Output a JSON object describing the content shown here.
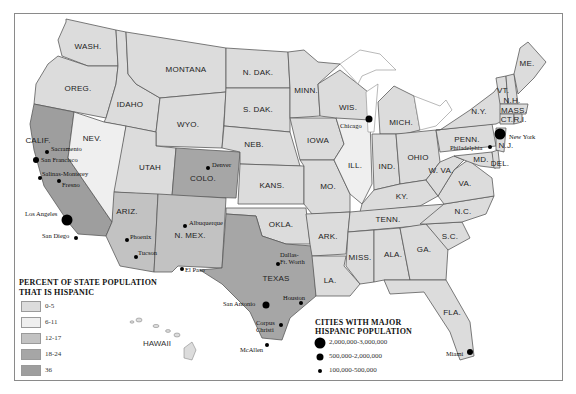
{
  "colors": {
    "c0_5": "#dcdcdc",
    "c6_11": "#efefef",
    "c12_17": "#c2c2c2",
    "c18_24": "#a6a6a6",
    "c36": "#9e9e9e",
    "border": "#5a5a5a"
  },
  "states": [
    {
      "id": "WA",
      "label": "WASH.",
      "x": 88,
      "y": 46,
      "bin": "c0_5",
      "points": "66,19 116,30 118,66 88,66 62,56 58,40 66,22"
    },
    {
      "id": "OR",
      "label": "OREG.",
      "x": 78,
      "y": 88,
      "bin": "c0_5",
      "points": "58,56 88,66 118,66 116,84 106,118 34,104 36,84 48,64"
    },
    {
      "id": "ID",
      "label": "IDAHO",
      "x": 130,
      "y": 104,
      "bin": "c0_5",
      "points": "116,30 126,32 128,74 136,84 160,98 156,132 104,122 106,118 116,84 118,66"
    },
    {
      "id": "MT",
      "label": "MONTANA",
      "x": 186,
      "y": 69,
      "bin": "c0_5",
      "points": "126,32 226,48 226,92 160,98 136,84 128,74"
    },
    {
      "id": "WY",
      "label": "WYO.",
      "x": 188,
      "y": 124,
      "bin": "c0_5",
      "points": "160,98 226,92 222,148 156,146 156,132"
    },
    {
      "id": "CA",
      "label": "CALIF.",
      "x": 38,
      "y": 140,
      "bin": "c36",
      "points": "34,104 74,112 68,158 112,222 106,236 78,234 68,222 44,186 34,150 30,124"
    },
    {
      "id": "NV",
      "label": "NEV.",
      "x": 92,
      "y": 138,
      "bin": "c6_11",
      "points": "74,112 104,122 126,126 114,208 112,222 68,158"
    },
    {
      "id": "UT",
      "label": "UTAH",
      "x": 150,
      "y": 167,
      "bin": "c0_5",
      "points": "126,126 156,132 156,146 176,148 172,196 114,192"
    },
    {
      "id": "CO",
      "label": "COLO.",
      "x": 203,
      "y": 178,
      "bin": "c18_24",
      "points": "176,148 240,152 236,198 172,196"
    },
    {
      "id": "AZ",
      "label": "ARIZ.",
      "x": 127,
      "y": 211,
      "bin": "c12_17",
      "points": "114,192 158,194 154,272 120,266 106,236 112,222"
    },
    {
      "id": "NM",
      "label": "N. MEX.",
      "x": 190,
      "y": 235,
      "bin": "c12_17",
      "points": "158,194 226,198 222,268 178,266 172,272 154,272"
    },
    {
      "id": "ND",
      "label": "N. DAK.",
      "x": 258,
      "y": 72,
      "bin": "c0_5",
      "points": "226,48 288,52 290,88 226,88"
    },
    {
      "id": "SD",
      "label": "S. DAK.",
      "x": 258,
      "y": 109,
      "bin": "c0_5",
      "points": "226,88 290,88 290,132 224,126"
    },
    {
      "id": "NE",
      "label": "NEB.",
      "x": 254,
      "y": 144,
      "bin": "c0_5",
      "points": "224,126 290,132 300,166 240,164 240,152 222,148"
    },
    {
      "id": "KS",
      "label": "KANS.",
      "x": 272,
      "y": 185,
      "bin": "c0_5",
      "points": "240,164 304,166 304,204 238,204"
    },
    {
      "id": "OK",
      "label": "OKLA.",
      "x": 281,
      "y": 224,
      "bin": "c0_5",
      "points": "226,208 306,208 310,244 286,244 262,236 256,216 226,214"
    },
    {
      "id": "TX",
      "label": "TEXAS",
      "x": 276,
      "y": 278,
      "bin": "c18_24",
      "points": "226,214 256,216 262,236 286,244 312,246 316,296 290,318 282,340 262,338 250,312 236,298 222,284 200,270 222,268"
    },
    {
      "id": "MN",
      "label": "MINN.",
      "x": 306,
      "y": 90,
      "bin": "c0_5",
      "points": "288,52 304,50 318,62 340,64 318,84 320,116 290,118 290,88"
    },
    {
      "id": "IA",
      "label": "IOWA",
      "x": 318,
      "y": 140,
      "bin": "c0_5",
      "points": "290,118 336,118 344,144 334,160 300,160"
    },
    {
      "id": "MO",
      "label": "MO.",
      "x": 328,
      "y": 186,
      "bin": "c0_5",
      "points": "300,160 334,160 350,194 350,212 312,214 304,204 304,166"
    },
    {
      "id": "AR",
      "label": "ARK.",
      "x": 328,
      "y": 236,
      "bin": "c0_5",
      "points": "306,214 350,212 346,254 312,256 310,244"
    },
    {
      "id": "LA",
      "label": "LA.",
      "x": 330,
      "y": 280,
      "bin": "c0_5",
      "points": "312,256 346,256 344,266 360,284 350,296 322,296 316,296"
    },
    {
      "id": "WI",
      "label": "WIS.",
      "x": 348,
      "y": 107,
      "bin": "c0_5",
      "points": "318,84 340,70 358,84 368,92 368,132 336,118 320,116"
    },
    {
      "id": "IL",
      "label": "ILL.",
      "x": 355,
      "y": 165,
      "bin": "c6_11",
      "points": "336,118 370,120 372,184 362,204 350,194 334,160 344,144"
    },
    {
      "id": "MI",
      "label": "MICH.",
      "x": 401,
      "y": 122,
      "bin": "c0_5",
      "points": "378,102 394,86 414,96 420,130 404,134 380,134"
    },
    {
      "id": "IN",
      "label": "IND.",
      "x": 387,
      "y": 166,
      "bin": "c0_5",
      "points": "372,134 396,134 400,184 374,190"
    },
    {
      "id": "OH",
      "label": "OHIO",
      "x": 418,
      "y": 157,
      "bin": "c0_5",
      "points": "396,134 436,130 440,162 426,180 400,184"
    },
    {
      "id": "KY",
      "label": "KY.",
      "x": 402,
      "y": 196,
      "bin": "c0_5",
      "points": "362,204 374,190 400,184 426,180 438,196 420,206 360,212"
    },
    {
      "id": "TN",
      "label": "TENN.",
      "x": 388,
      "y": 219,
      "bin": "c0_5",
      "points": "350,212 420,206 446,204 440,224 348,232"
    },
    {
      "id": "MS",
      "label": "MISS.",
      "x": 360,
      "y": 257,
      "bin": "c0_5",
      "points": "348,232 374,230 374,282 360,284 346,266"
    },
    {
      "id": "AL",
      "label": "ALA.",
      "x": 393,
      "y": 254,
      "bin": "c0_5",
      "points": "374,230 400,228 410,280 384,280 374,282"
    },
    {
      "id": "GA",
      "label": "GA.",
      "x": 424,
      "y": 249,
      "bin": "c0_5",
      "points": "400,228 426,224 448,248 446,280 410,280"
    },
    {
      "id": "FL",
      "label": "FLA.",
      "x": 452,
      "y": 312,
      "bin": "c0_5",
      "points": "384,280 446,280 470,322 474,356 460,360 450,332 424,292 390,294"
    },
    {
      "id": "SC",
      "label": "S.C.",
      "x": 450,
      "y": 236,
      "bin": "c0_5",
      "points": "426,224 462,222 470,238 448,250"
    },
    {
      "id": "NC",
      "label": "N.C.",
      "x": 463,
      "y": 211,
      "bin": "c0_5",
      "points": "420,224 444,204 494,196 486,214 462,222 426,224"
    },
    {
      "id": "VA",
      "label": "VA.",
      "x": 465,
      "y": 183,
      "bin": "c0_5",
      "points": "438,196 454,170 468,160 492,178 494,196 444,204"
    },
    {
      "id": "WV",
      "label": "W. VA.",
      "x": 441,
      "y": 170,
      "bin": "c0_5",
      "points": "426,180 440,162 454,156 464,160 454,170 438,196"
    },
    {
      "id": "PA",
      "label": "PENN.",
      "x": 467,
      "y": 139,
      "bin": "c0_5",
      "points": "436,130 492,124 496,146 440,152"
    },
    {
      "id": "NY",
      "label": "N.Y.",
      "x": 479,
      "y": 111,
      "bin": "c0_5",
      "points": "440,130 470,110 494,92 500,84 504,120 496,124 436,130"
    },
    {
      "id": "MD",
      "label": "MD.",
      "x": 481,
      "y": 159,
      "bin": "c0_5",
      "points": "454,156 492,152 496,168 480,166 464,160"
    },
    {
      "id": "DE",
      "label": "DEL.",
      "x": 500,
      "y": 163,
      "bin": "c0_5",
      "points": "492,152 498,150 500,168 494,168"
    },
    {
      "id": "NJ",
      "label": "N.J.",
      "x": 506,
      "y": 145,
      "bin": "c0_5",
      "points": "496,128 506,128 504,152 496,150"
    },
    {
      "id": "VT",
      "label": "VT.",
      "x": 503,
      "y": 90,
      "bin": "c0_5",
      "points": "496,78 506,76 508,104 500,104"
    },
    {
      "id": "NH",
      "label": "N.H.",
      "x": 512,
      "y": 100,
      "bin": "c0_5",
      "points": "506,76 514,74 518,104 508,104"
    },
    {
      "id": "ME",
      "label": "ME.",
      "x": 527,
      "y": 63,
      "bin": "c0_5",
      "points": "514,74 520,48 528,42 546,62 534,78 518,94"
    },
    {
      "id": "MA",
      "label": "MASS.",
      "x": 514,
      "y": 110,
      "bin": "c0_5",
      "points": "500,104 528,104 526,114 500,114"
    },
    {
      "id": "CT",
      "label": "CT.",
      "x": 507,
      "y": 119,
      "bin": "c0_5",
      "points": "500,114 514,114 514,124 500,124"
    },
    {
      "id": "RI",
      "label": "R.I.",
      "x": 520,
      "y": 119,
      "bin": "c0_5",
      "points": "514,114 522,114 522,122 514,124"
    }
  ],
  "lakes": [
    "340,64 360,50 380,54 396,70 376,70 362,76 358,84",
    "366,92 378,84 374,132 368,132",
    "414,96 440,106 446,100 452,110 436,126 420,130"
  ],
  "cities": [
    {
      "name": "Sacramento",
      "x": 47,
      "y": 152,
      "size": 4,
      "lx": 51,
      "ly": 145
    },
    {
      "name": "San Francisco",
      "x": 36,
      "y": 160,
      "size": 6,
      "lx": 41,
      "ly": 156
    },
    {
      "name": "Salinas-Monterey",
      "x": 40,
      "y": 178,
      "size": 4,
      "lx": 42,
      "ly": 170
    },
    {
      "name": "Fresno",
      "x": 59,
      "y": 181,
      "size": 4,
      "lx": 62,
      "ly": 181
    },
    {
      "name": "Los Angeles",
      "x": 67,
      "y": 220,
      "size": 11,
      "lx": 25,
      "ly": 210
    },
    {
      "name": "San Diego",
      "x": 76,
      "y": 238,
      "size": 4,
      "lx": 42,
      "ly": 232
    },
    {
      "name": "Phoenix",
      "x": 127,
      "y": 240,
      "size": 4,
      "lx": 130,
      "ly": 233
    },
    {
      "name": "Tucson",
      "x": 136,
      "y": 257,
      "size": 4,
      "lx": 138,
      "ly": 249
    },
    {
      "name": "Denver",
      "x": 208,
      "y": 168,
      "size": 4,
      "lx": 212,
      "ly": 161
    },
    {
      "name": "Albuquerque",
      "x": 185,
      "y": 226,
      "size": 4,
      "lx": 189,
      "ly": 219
    },
    {
      "name": "El Paso",
      "x": 182,
      "y": 269,
      "size": 4,
      "lx": 185,
      "ly": 266
    },
    {
      "name": "Dallas-\nFt. Worth",
      "x": 278,
      "y": 264,
      "size": 4,
      "lx": 280,
      "ly": 251
    },
    {
      "name": "Houston",
      "x": 301,
      "y": 303,
      "size": 4,
      "lx": 283,
      "ly": 294
    },
    {
      "name": "San Antonio",
      "x": 266,
      "y": 305,
      "size": 7,
      "lx": 223,
      "ly": 300
    },
    {
      "name": "Corpus\nChristi",
      "x": 281,
      "y": 325,
      "size": 4,
      "lx": 256,
      "ly": 319
    },
    {
      "name": "McAllen",
      "x": 267,
      "y": 345,
      "size": 4,
      "lx": 240,
      "ly": 346
    },
    {
      "name": "Chicago",
      "x": 369,
      "y": 119,
      "size": 7,
      "lx": 340,
      "ly": 122
    },
    {
      "name": "New York",
      "x": 500,
      "y": 134,
      "size": 11,
      "lx": 509,
      "ly": 133
    },
    {
      "name": "Philadelphia",
      "x": 490,
      "y": 147,
      "size": 4,
      "lx": 450,
      "ly": 144
    },
    {
      "name": "Miami",
      "x": 470,
      "y": 352,
      "size": 6,
      "lx": 446,
      "ly": 350
    }
  ],
  "legend_percent": {
    "title_line1": "PERCENT OF STATE POPULATION",
    "title_line2": "THAT IS HISPANIC",
    "items": [
      {
        "label": "0-5",
        "color": "#dcdcdc"
      },
      {
        "label": "6-11",
        "color": "#efefef"
      },
      {
        "label": "12-17",
        "color": "#c2c2c2"
      },
      {
        "label": "18-24",
        "color": "#a6a6a6"
      },
      {
        "label": "36",
        "color": "#9e9e9e"
      }
    ]
  },
  "legend_cities": {
    "title_line1": "CITIES WITH MAJOR",
    "title_line2": "HISPANIC POPULATION",
    "items": [
      {
        "label": "2,000,000-3,000,000",
        "size": 11
      },
      {
        "label": "500,000-2,000,000",
        "size": 7
      },
      {
        "label": "100,000-500,000",
        "size": 4
      }
    ]
  },
  "hawaii": {
    "label": "HAWAII"
  }
}
